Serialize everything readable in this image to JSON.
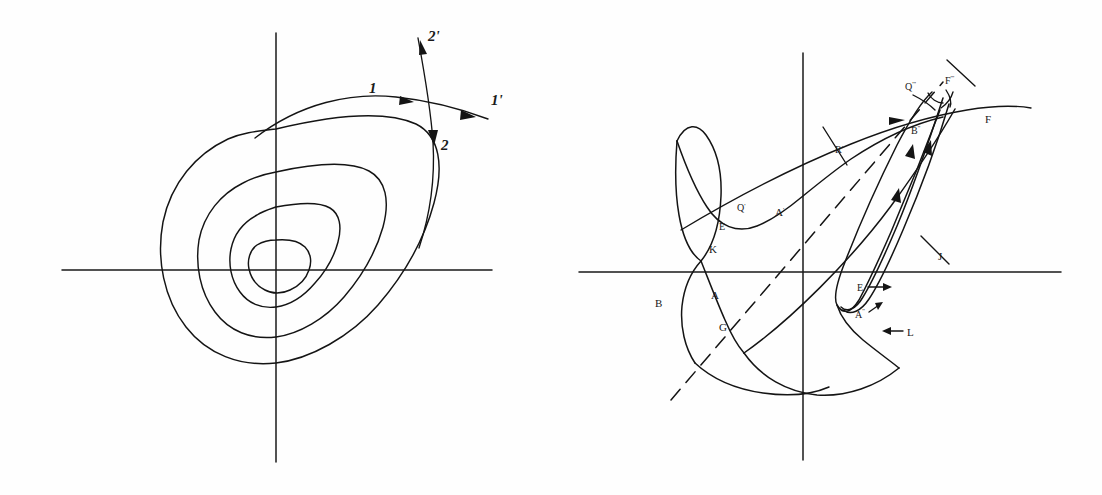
{
  "figure": {
    "background_color": "#fefefe",
    "ink_color": "#141414",
    "panels": [
      {
        "id": "left",
        "name": "nested-closed-orbits-phase-portrait",
        "description": "Four nested tilted closed orbits about an origin with horizontal and vertical coordinate axes, plus two crossing directional curves labelled 1, 1', 2, 2'.",
        "origin": {
          "x": 276,
          "y": 270
        },
        "axes": {
          "horizontal": {
            "x1": 62,
            "y1": 270,
            "x2": 492,
            "y2": 270
          },
          "vertical": {
            "x1": 276,
            "y1": 33,
            "x2": 276,
            "y2": 462
          }
        },
        "orbit_count": 4,
        "labels": [
          {
            "text": "1",
            "x": 369,
            "y": 93
          },
          {
            "text": "1'",
            "x": 493,
            "y": 105
          },
          {
            "text": "2",
            "x": 442,
            "y": 146
          },
          {
            "text": "2'",
            "x": 430,
            "y": 41
          }
        ]
      },
      {
        "id": "right",
        "name": "homoclinic-tangle-poincare-map",
        "description": "A self-intersecting invariant manifold curve (homoclinic tangle) with a long narrow lobe extending to the upper right, a dashed unstable eigendirection line, and lettered intersection points.",
        "origin": {
          "x": 252,
          "y": 272
        },
        "axes": {
          "horizontal": {
            "x1": 28,
            "y1": 272,
            "x2": 510,
            "y2": 272
          },
          "vertical": {
            "x1": 252,
            "y1": 53,
            "x2": 252,
            "y2": 460
          }
        },
        "labels": [
          {
            "text": "Q",
            "prime": "'''",
            "x": 362,
            "y": 86,
            "name": "label-Q-triple-prime"
          },
          {
            "text": "F",
            "prime": "'''",
            "x": 398,
            "y": 80,
            "name": "label-F-triple-prime"
          },
          {
            "text": "B",
            "prime": "''",
            "x": 367,
            "y": 130,
            "name": "label-B-double-prime"
          },
          {
            "text": "F",
            "prime": "",
            "x": 436,
            "y": 119,
            "name": "label-F"
          },
          {
            "text": "R",
            "prime": "'",
            "x": 287,
            "y": 149,
            "name": "label-R-prime"
          },
          {
            "text": "Q",
            "prime": "'",
            "x": 190,
            "y": 207,
            "name": "label-Q-prime"
          },
          {
            "text": "A",
            "prime": "'",
            "x": 228,
            "y": 211,
            "name": "label-A-prime"
          },
          {
            "text": "E",
            "prime": "",
            "x": 171,
            "y": 226,
            "name": "label-E-upper"
          },
          {
            "text": "K",
            "prime": "",
            "x": 162,
            "y": 249,
            "name": "label-K"
          },
          {
            "text": "J",
            "prime": "",
            "x": 389,
            "y": 256,
            "name": "label-J"
          },
          {
            "text": "B",
            "prime": "",
            "x": 108,
            "y": 303,
            "name": "label-B"
          },
          {
            "text": "A",
            "prime": "",
            "x": 163,
            "y": 295,
            "name": "label-A"
          },
          {
            "text": "G",
            "prime": "",
            "x": 171,
            "y": 327,
            "name": "label-G"
          },
          {
            "text": "E",
            "prime": "",
            "x": 312,
            "y": 290,
            "name": "label-E-lower"
          },
          {
            "text": "A",
            "prime": "''",
            "x": 310,
            "y": 315,
            "name": "label-A-double-prime"
          },
          {
            "text": "L",
            "prime": "",
            "x": 354,
            "y": 335,
            "name": "label-L"
          }
        ]
      }
    ]
  }
}
